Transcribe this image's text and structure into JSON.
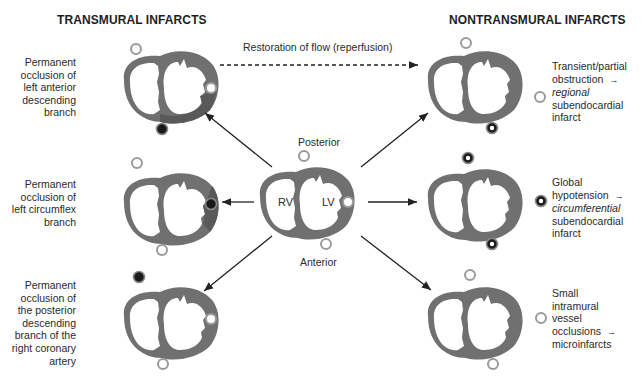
{
  "headers": {
    "left": "TRANSMURAL INFARCTS",
    "right": "NONTRANSMURAL INFARCTS"
  },
  "reperfusion_label": "Restoration of flow (reperfusion)",
  "center": {
    "posterior": "Posterior",
    "anterior": "Anterior",
    "rv": "RV",
    "lv": "LV"
  },
  "left_labels": [
    {
      "lines": [
        "Permanent",
        "occlusion of",
        "left anterior",
        "descending",
        "branch"
      ]
    },
    {
      "lines": [
        "Permanent",
        "occlusion of",
        "left circumflex",
        "branch"
      ]
    },
    {
      "lines": [
        "Permanent",
        "occlusion of",
        "the posterior",
        "descending",
        "branch of the",
        "right coronary",
        "artery"
      ]
    }
  ],
  "right_labels": [
    {
      "l1": "Transient/partial",
      "l2": "obstruction",
      "l3": "regional",
      "l4": "subendocardial",
      "l5": "infarct"
    },
    {
      "l1": "Global",
      "l2": "hypotension",
      "l3": "circumferential",
      "l4": "subendocardial",
      "l5": "infarct"
    },
    {
      "l1": "Small",
      "l2": "intramural",
      "l3": "vessel",
      "l4": "occlusions",
      "l5": "microinfarcts"
    }
  ],
  "arrow_glyph": "→",
  "colors": {
    "tissue": "#6e6e6e",
    "infarct": "#555555",
    "vessel_open": "#9a9a9a",
    "vessel_occluded": "#1a1a1a"
  }
}
